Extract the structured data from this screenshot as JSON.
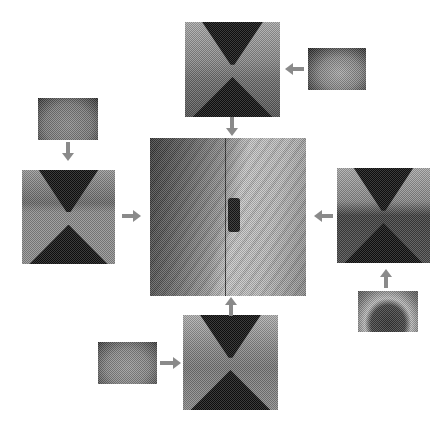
{
  "figure": {
    "background": "#ffffff",
    "arrow_color": "#8a8a8a",
    "center_panel": {
      "label": "",
      "x": 150,
      "y": 138,
      "w": 156,
      "h": 158
    },
    "perspective_panels": [
      {
        "id": "top",
        "x": 185,
        "y": 22,
        "w": 95,
        "h": 95,
        "source_thumb": "top-right",
        "arrow_to_center": "down"
      },
      {
        "id": "left",
        "x": 22,
        "y": 170,
        "w": 93,
        "h": 94,
        "source_thumb": "left-top",
        "arrow_to_center": "right"
      },
      {
        "id": "right",
        "x": 337,
        "y": 168,
        "w": 93,
        "h": 95,
        "source_thumb": "right-bottom",
        "arrow_to_center": "left"
      },
      {
        "id": "bottom",
        "x": 183,
        "y": 315,
        "w": 95,
        "h": 95,
        "source_thumb": "bottom-left",
        "arrow_to_center": "up"
      }
    ],
    "fisheye_thumbs": [
      {
        "id": "top-right",
        "x": 308,
        "y": 48,
        "w": 58,
        "h": 42
      },
      {
        "id": "left-top",
        "x": 38,
        "y": 98,
        "w": 60,
        "h": 42
      },
      {
        "id": "right-bottom",
        "x": 358,
        "y": 291,
        "w": 60,
        "h": 41
      },
      {
        "id": "bottom-left",
        "x": 98,
        "y": 342,
        "w": 59,
        "h": 42
      }
    ]
  }
}
